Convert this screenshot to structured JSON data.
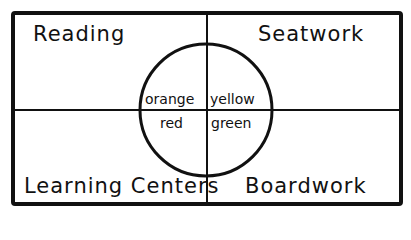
{
  "diagram": {
    "quadrants": {
      "top_left": "Reading",
      "top_right": "Seatwork",
      "bottom_left": "Learning Centers",
      "bottom_right": "Boardwork"
    },
    "circle": {
      "top_left": "orange",
      "top_right": "yellow",
      "bottom_left": "red",
      "bottom_right": "green"
    },
    "colors": {
      "ink": "#111111",
      "background": "#ffffff"
    }
  }
}
